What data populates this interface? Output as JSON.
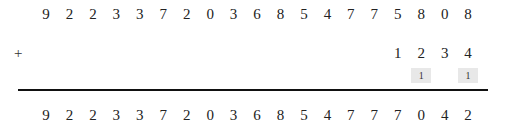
{
  "problem": {
    "operator": "+",
    "addend1": [
      "9",
      "2",
      "2",
      "3",
      "3",
      "7",
      "2",
      "0",
      "3",
      "6",
      "8",
      "5",
      "4",
      "7",
      "7",
      "5",
      "8",
      "0",
      "8"
    ],
    "addend2": [
      "",
      "",
      "",
      "",
      "",
      "",
      "",
      "",
      "",
      "",
      "",
      "",
      "",
      "",
      "",
      "1",
      "2",
      "3",
      "4"
    ],
    "carries": [
      "",
      "",
      "",
      "",
      "",
      "",
      "",
      "",
      "",
      "",
      "",
      "",
      "",
      "",
      "",
      "",
      "1",
      "",
      "1"
    ],
    "result": [
      "9",
      "2",
      "2",
      "3",
      "3",
      "7",
      "2",
      "0",
      "3",
      "6",
      "8",
      "5",
      "4",
      "7",
      "7",
      "7",
      "0",
      "4",
      "2"
    ]
  }
}
